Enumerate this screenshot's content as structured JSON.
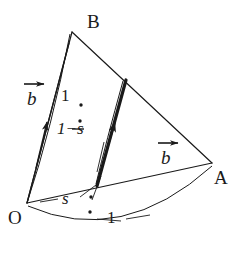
{
  "figure": {
    "background_color": "#ffffff",
    "stroke_color": "#1a1a1a",
    "vertices": [
      {
        "name": "O",
        "label": "O",
        "x": 27,
        "y": 203,
        "label_x": 10,
        "label_y": 209
      },
      {
        "name": "A",
        "label": "A",
        "x": 212,
        "y": 163,
        "label_x": 214,
        "label_y": 170
      },
      {
        "name": "B",
        "label": "B",
        "x": 72,
        "y": 32,
        "label_x": 87,
        "label_y": 14
      }
    ],
    "labels": {
      "vector_b_left": "b",
      "vector_b_right": "b",
      "ratio_top_first": "1",
      "ratio_top_second": "1−s",
      "ratio_bottom_first": "s",
      "ratio_bottom_second": "1"
    },
    "label_positions": {
      "vector_b_left": {
        "x": 22,
        "y": 79
      },
      "vector_b_right": {
        "x": 155,
        "y": 138
      },
      "ratio_top_first": {
        "x": 61,
        "y": 89
      },
      "ratio_top_second": {
        "x": 57,
        "y": 128
      },
      "ratio_bottom_first": {
        "x": 63,
        "y": 196
      },
      "ratio_bottom_second": {
        "x": 106,
        "y": 213
      }
    },
    "ratio_dots": [
      {
        "name": "top-colon-upper",
        "x": 80,
        "y": 104
      },
      {
        "name": "top-colon-lower",
        "x": 80,
        "y": 120
      },
      {
        "name": "bottom-colon-upper",
        "x": 90,
        "y": 196
      },
      {
        "name": "bottom-colon-lower",
        "x": 89,
        "y": 211
      }
    ],
    "segments": [
      {
        "name": "edge-ob",
        "from": [
          27,
          203
        ],
        "to": [
          72,
          32
        ],
        "width": 1.2
      },
      {
        "name": "edge-ba",
        "from": [
          72,
          32
        ],
        "to": [
          212,
          163
        ],
        "width": 1.2
      },
      {
        "name": "edge-oa",
        "from": [
          27,
          203
        ],
        "to": [
          212,
          163
        ],
        "width": 1.2
      },
      {
        "name": "vector-ob-arrow",
        "from": [
          27,
          203
        ],
        "to": [
          68,
          40
        ],
        "width": 1.3
      },
      {
        "name": "vector-pq-thick",
        "from": [
          97,
          186
        ],
        "to": [
          126,
          80
        ],
        "width": 3.2
      },
      {
        "name": "line-p-to-oa",
        "from": [
          97,
          186
        ],
        "to": [
          101,
          172
        ],
        "width": 1.0
      }
    ],
    "arcs": [
      {
        "name": "arc-ob-curve",
        "path": "M 27 203 Q 52 130 70 35",
        "width": 1.1
      },
      {
        "name": "arc-pq-curve",
        "path": "M 96 184 Q 109 140 124 82",
        "width": 1.1
      },
      {
        "name": "arc-oa-curve",
        "path": "M 27 205 Q 120 245 212 166",
        "width": 1.1
      }
    ],
    "leaders": [
      {
        "name": "leader-ratio-top",
        "path": "M 88 131 L 99 118",
        "width": 1.0
      },
      {
        "name": "leader-ratio-top-dash",
        "path": "M 70 128 L 83 128",
        "width": 1.2
      },
      {
        "name": "leader-ratio-bottom-left",
        "path": "M 56 198 L 42 201",
        "width": 1.0
      },
      {
        "name": "leader-ratio-bottom-down",
        "path": "M 98 190 L 106 203",
        "width": 1.0
      },
      {
        "name": "leader-ratio-one",
        "path": "M 100 218 L 121 220",
        "width": 1.0
      },
      {
        "name": "leader-ratio-one-right",
        "path": "M 124 219 L 145 216",
        "width": 1.0
      }
    ],
    "arrowheads": [
      {
        "name": "arrowhead-ob",
        "x": 47,
        "y": 118,
        "angle": -75,
        "size": 9
      },
      {
        "name": "arrowhead-pq",
        "x": 115,
        "y": 120,
        "angle": -74,
        "size": 10
      },
      {
        "name": "arrowhead-vec-b-left",
        "x": 44,
        "y": 83,
        "angle": 0,
        "size": 8
      },
      {
        "name": "arrowhead-vec-b-right",
        "x": 177,
        "y": 142,
        "angle": 0,
        "size": 8
      }
    ]
  }
}
